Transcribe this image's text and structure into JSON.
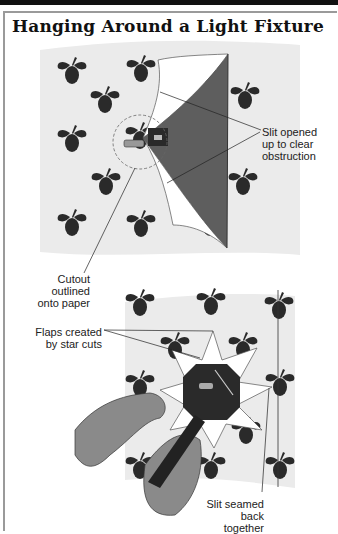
{
  "title": "Hanging Around a Light Fixture",
  "callouts": {
    "slit_opened": [
      "Slit opened",
      "up to clear",
      "obstruction"
    ],
    "cutout_outlined": [
      "Cutout outlined",
      "onto paper"
    ],
    "flaps_created": [
      "Flaps created",
      "by star cuts"
    ],
    "slit_seamed": [
      "Slit seamed",
      "back together"
    ]
  },
  "colors": {
    "wallpaper_bg": "#ebebeb",
    "motif": "#2a2a2a",
    "shadow_flap": "#5e5e5e",
    "paper": "#ffffff",
    "hand": "#8a8a8a"
  }
}
